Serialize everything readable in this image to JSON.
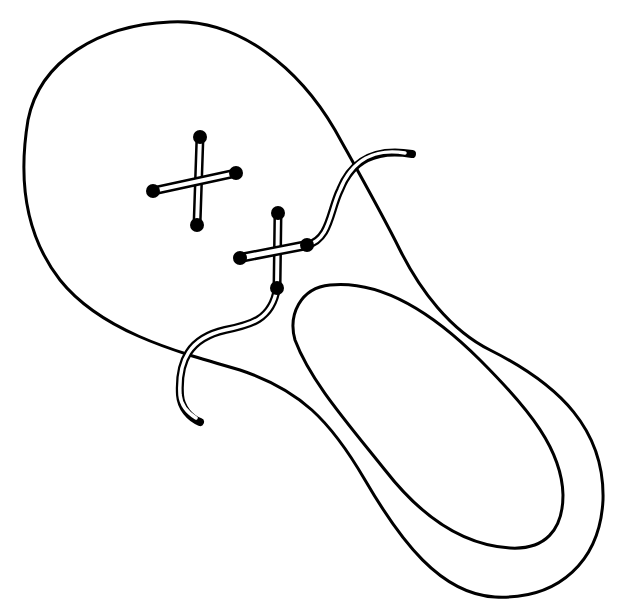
{
  "illustration": {
    "subject": "Line drawing of a shoe seen from above with two crossed laces",
    "stroke_color": "#000000",
    "background_color": "#ffffff",
    "elements": {
      "outer_sole": "shoe-outline",
      "inner_opening": "shoe-opening",
      "lace_cross_1": "first-lace-cross",
      "lace_cross_2": "second-lace-cross",
      "lace_end_top": "lace-end-right",
      "lace_end_bottom": "lace-end-left"
    },
    "eyelets": [
      {
        "x": 200,
        "y": 137
      },
      {
        "x": 153,
        "y": 191
      },
      {
        "x": 236,
        "y": 173
      },
      {
        "x": 197,
        "y": 225
      },
      {
        "x": 278,
        "y": 213
      },
      {
        "x": 240,
        "y": 258
      },
      {
        "x": 307,
        "y": 245
      },
      {
        "x": 277,
        "y": 288
      }
    ]
  }
}
